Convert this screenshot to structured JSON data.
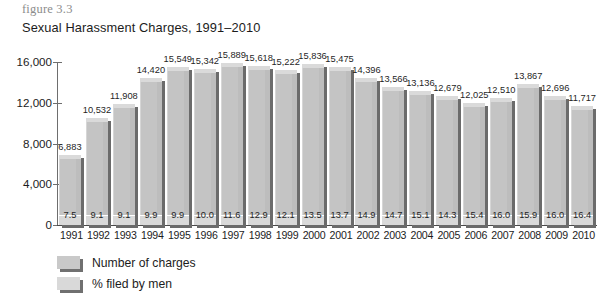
{
  "figure_label": "figure 3.3",
  "title": "Sexual Harassment Charges, 1991–2010",
  "yaxis": {
    "ticks": [
      "16,000",
      "12,000",
      "8,000",
      "4,000",
      "0"
    ]
  },
  "legend": {
    "items": [
      {
        "label": "Number of charges",
        "swatch": "bar-swatch-dark"
      },
      {
        "label": "% filed by men",
        "swatch": "bar-swatch-light"
      }
    ]
  },
  "chart_data": {
    "type": "bar",
    "title": "Sexual Harassment Charges, 1991–2010",
    "xlabel": "",
    "ylabel": "",
    "ylim": [
      0,
      16000
    ],
    "yticks": [
      0,
      4000,
      8000,
      12000,
      16000
    ],
    "grid": false,
    "legend_position": "bottom-left",
    "categories": [
      "1991",
      "1992",
      "1993",
      "1994",
      "1995",
      "1996",
      "1997",
      "1998",
      "1999",
      "2000",
      "2001",
      "2002",
      "2003",
      "2004",
      "2005",
      "2006",
      "2007",
      "2008",
      "2009",
      "2010"
    ],
    "series": [
      {
        "name": "Number of charges",
        "values": [
          6883,
          10532,
          11908,
          14420,
          15549,
          15342,
          15889,
          15618,
          15222,
          15836,
          15475,
          14396,
          13566,
          13136,
          12679,
          12025,
          12510,
          13867,
          12696,
          11717
        ],
        "labels": [
          "6,883",
          "10,532",
          "11,908",
          "14,420",
          "15,549",
          "15,342",
          "15,889",
          "15,618",
          "15,222",
          "15,836",
          "15,475",
          "14,396",
          "13,566",
          "13,136",
          "12,679",
          "12,025",
          "12,510",
          "13,867",
          "12,696",
          "11,717"
        ]
      },
      {
        "name": "% filed by men",
        "values": [
          7.5,
          9.1,
          9.1,
          9.9,
          9.9,
          10.0,
          11.6,
          12.9,
          12.1,
          13.5,
          13.7,
          14.9,
          14.7,
          15.1,
          14.3,
          15.4,
          16.0,
          15.9,
          16.0,
          16.4
        ],
        "labels": [
          "7.5",
          "9.1",
          "9.1",
          "9.9",
          "9.9",
          "10.0",
          "11.6",
          "12.9",
          "12.1",
          "13.5",
          "13.7",
          "14.9",
          "14.7",
          "15.1",
          "14.3",
          "15.4",
          "16.0",
          "15.9",
          "16.0",
          "16.4"
        ]
      }
    ]
  }
}
